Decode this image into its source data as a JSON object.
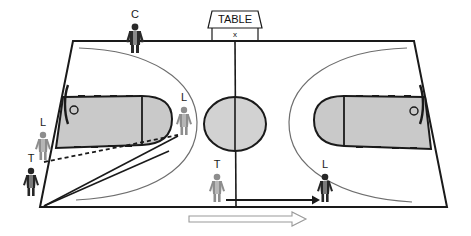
{
  "diagram": {
    "court": {
      "corners": {
        "top_left": [
          73,
          41
        ],
        "top_right": [
          414,
          41
        ],
        "bottom_right": [
          447,
          207
        ],
        "bottom_left": [
          40,
          207
        ]
      },
      "center_line_top": [
        235,
        41
      ],
      "center_line_bottom": [
        236,
        207
      ],
      "line_color": "#1a1a1a",
      "key_fill": "#c9c9c9",
      "circle_fill": "#d2d2d2",
      "arc_color": "#6e6e6e"
    },
    "table": {
      "label": "TABLE",
      "marker": "x"
    },
    "officials": [
      {
        "id": "official-c",
        "label": "C",
        "x": 135,
        "y": 36,
        "shade": "dark"
      },
      {
        "id": "official-l-left-wing",
        "label": "L",
        "x": 184,
        "y": 122,
        "shade": "gray"
      },
      {
        "id": "official-l-sideline",
        "label": "L",
        "x": 43,
        "y": 146,
        "shade": "gray"
      },
      {
        "id": "official-t-sideline",
        "label": "T",
        "x": 31,
        "y": 180,
        "shade": "dark"
      },
      {
        "id": "official-t-center",
        "label": "T",
        "x": 217,
        "y": 185,
        "shade": "gray"
      },
      {
        "id": "official-l-right",
        "label": "L",
        "x": 325,
        "y": 185,
        "shade": "dark"
      }
    ],
    "movement_arrows": [
      {
        "id": "arrow-t-to-l",
        "style": "solid",
        "from": [
          226,
          200
        ],
        "to": [
          318,
          200
        ]
      },
      {
        "id": "arrow-direction-of-play",
        "style": "hollow",
        "from": [
          189,
          219
        ],
        "to": [
          305,
          219
        ]
      }
    ],
    "sight_lines": [
      {
        "id": "sight-line-dashed",
        "style": "dashed",
        "from": [
          44,
          162
        ],
        "to": [
          176,
          135
        ]
      },
      {
        "id": "sight-line-upper",
        "style": "solid",
        "from": [
          44,
          206
        ],
        "to": [
          177,
          136
        ]
      },
      {
        "id": "sight-line-lower",
        "style": "solid",
        "from": [
          44,
          206
        ],
        "to": [
          168,
          150
        ]
      }
    ]
  }
}
